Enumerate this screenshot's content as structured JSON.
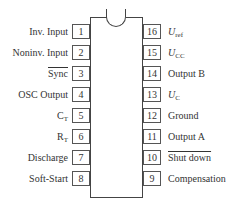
{
  "diagram": {
    "type": "ic-pinout",
    "package": "DIP-16",
    "left_pins": [
      {
        "number": "1",
        "label": "Inv. Input",
        "overline": false
      },
      {
        "number": "2",
        "label": "Noninv. Input",
        "overline": false
      },
      {
        "number": "3",
        "label": "Sync",
        "overline": true
      },
      {
        "number": "4",
        "label": "OSC Output",
        "overline": false
      },
      {
        "number": "5",
        "label": "C",
        "sub": "T",
        "overline": false
      },
      {
        "number": "6",
        "label": "R",
        "sub": "T",
        "overline": false
      },
      {
        "number": "7",
        "label": "Discharge",
        "overline": false
      },
      {
        "number": "8",
        "label": "Soft-Start",
        "overline": false
      }
    ],
    "right_pins": [
      {
        "number": "16",
        "label": "U",
        "sub": "ref",
        "italic": true,
        "overline": false
      },
      {
        "number": "15",
        "label": "U",
        "sub": "CC",
        "italic": true,
        "overline": false
      },
      {
        "number": "14",
        "label": "Output B",
        "overline": false
      },
      {
        "number": "13",
        "label": "U",
        "sub": "C",
        "italic": true,
        "overline": false
      },
      {
        "number": "12",
        "label": "Ground",
        "overline": false
      },
      {
        "number": "11",
        "label": "Output A",
        "overline": false
      },
      {
        "number": "10",
        "label": "Shut down",
        "overline": true
      },
      {
        "number": "9",
        "label": "Compensation",
        "overline": false
      }
    ]
  }
}
